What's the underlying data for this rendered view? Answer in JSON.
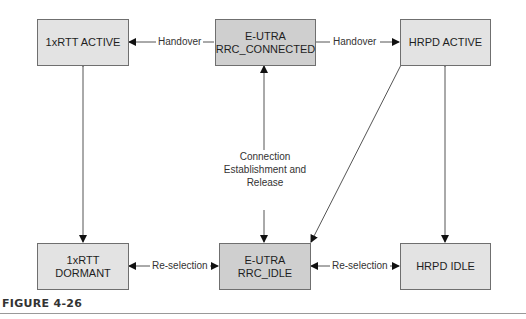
{
  "nodes": {
    "rtt_active": {
      "label": "1xRTT ACTIVE"
    },
    "eutra_connected": {
      "line1": "E-UTRA",
      "line2": "RRC_CONNECTED"
    },
    "hrpd_active": {
      "label": "HRPD ACTIVE"
    },
    "rtt_dormant": {
      "label": "1xRTT DORMANT"
    },
    "eutra_idle": {
      "line1": "E-UTRA",
      "line2": "RRC_IDLE"
    },
    "hrpd_idle": {
      "label": "HRPD IDLE"
    }
  },
  "edges": {
    "handover_left": "Handover",
    "handover_right": "Handover",
    "reselection_left": "Re-selection",
    "reselection_right": "Re-selection",
    "connection": {
      "line1": "Connection",
      "line2": "Establishment and",
      "line3": "Release"
    }
  },
  "caption": {
    "figure": "FIGURE 4-26"
  },
  "colors": {
    "box_light": "#e3e3e3",
    "box_dark": "#cfcfcf",
    "border": "#6f6f6f",
    "line": "#555555"
  }
}
